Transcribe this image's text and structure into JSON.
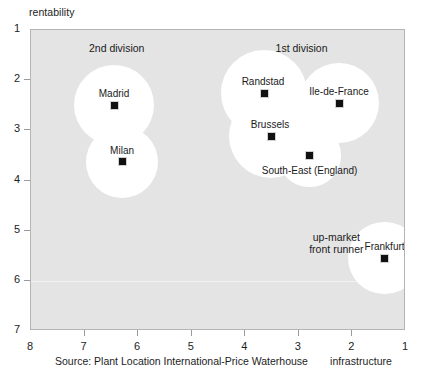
{
  "chart_data": {
    "type": "scatter",
    "title": "",
    "xlabel": "infrastructure",
    "ylabel": "rentability",
    "xlim": [
      8,
      1
    ],
    "ylim": [
      1,
      7
    ],
    "x_ticks": [
      "8",
      "7",
      "6",
      "5",
      "4",
      "3",
      "2",
      "1"
    ],
    "y_ticks": [
      "1",
      "2",
      "3",
      "4",
      "5",
      "6",
      "7"
    ],
    "x_axis_reversed": true,
    "y_axis_reversed": true,
    "grid": "single faint horizontal line at rentability = 6",
    "legend_position": "none",
    "marker_style": "black square",
    "bubble_style": "white filled circle halo behind each point",
    "points": [
      {
        "label": "Madrid",
        "x": 6.45,
        "y": 2.5,
        "bubble_radius_units": 0.8
      },
      {
        "label": "Milan",
        "x": 6.3,
        "y": 3.63,
        "bubble_radius_units": 0.72
      },
      {
        "label": "Randstad",
        "x": 3.65,
        "y": 2.26,
        "bubble_radius_units": 0.86
      },
      {
        "label": "Brussels",
        "x": 3.52,
        "y": 3.12,
        "bubble_radius_units": 0.84
      },
      {
        "label": "Ile-de-France",
        "x": 2.25,
        "y": 2.46,
        "bubble_radius_units": 0.8
      },
      {
        "label": "South-East (England)",
        "x": 2.8,
        "y": 3.5,
        "bubble_radius_units": 0.62
      },
      {
        "label": "Frankfurt",
        "x": 1.4,
        "y": 5.55,
        "bubble_radius_units": 0.72
      }
    ],
    "annotations": [
      {
        "text": "2nd division",
        "x": 6.4,
        "y": 1.35
      },
      {
        "text": "1st division",
        "x": 2.95,
        "y": 1.35
      },
      {
        "text": "up-market\nfront runner",
        "x": 2.3,
        "y": 5.25
      }
    ],
    "source": "Source: Plant Location International-Price Waterhouse"
  },
  "colors": {
    "plot_background": "#e4e4e4",
    "bubble_fill": "#ffffff",
    "marker": "#111111",
    "gridline": "#f2f2f2",
    "frame": "#b4b4b4",
    "text": "#1a1a1a"
  },
  "point_labels": {
    "madrid": "Madrid",
    "milan": "Milan",
    "randstad": "Randstad",
    "brussels": "Brussels",
    "ile_de_france": "Ile-de-France",
    "south_east": "South-East (England)",
    "frankfurt": "Frankfurt"
  },
  "annotation_labels": {
    "second_division": "2nd division",
    "first_division": "1st division",
    "up_market_line1": "up-market",
    "up_market_line2": "front runner"
  },
  "axis_labels": {
    "y_title": "rentability",
    "x_title": "infrastructure"
  },
  "y_tick_labels": [
    "1",
    "2",
    "3",
    "4",
    "5",
    "6",
    "7"
  ],
  "x_tick_labels": [
    "8",
    "7",
    "6",
    "5",
    "4",
    "3",
    "2",
    "1"
  ],
  "source_text": "Source: Plant Location International-Price Waterhouse"
}
